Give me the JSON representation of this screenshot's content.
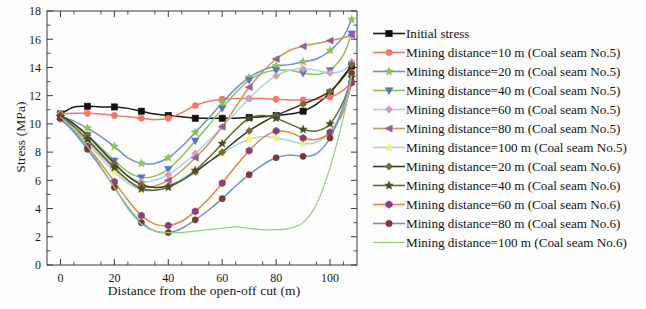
{
  "chart_data": {
    "type": "line",
    "title": "",
    "xlabel": "Distance from the open-off cut (m)",
    "ylabel": "Stress (MPa)",
    "xlim": [
      -5,
      110
    ],
    "ylim": [
      0,
      18
    ],
    "xticks": [
      0,
      20,
      40,
      60,
      80,
      100
    ],
    "yticks": [
      0,
      2,
      4,
      6,
      8,
      10,
      12,
      14,
      16,
      18
    ],
    "xtick_labels": [
      "0",
      "20",
      "40",
      "60",
      "80",
      "100"
    ],
    "ytick_labels": [
      "0",
      "2",
      "4",
      "6",
      "8",
      "10",
      "12",
      "14",
      "16",
      "18"
    ],
    "grid": false,
    "legend_position": "right",
    "series": [
      {
        "name": "Initial stress",
        "color": "#1a1a1a",
        "marker": "square",
        "marker_color": "#111111",
        "x": [
          0,
          5,
          10,
          15,
          20,
          25,
          30,
          35,
          40,
          45,
          50,
          55,
          60,
          65,
          70,
          75,
          80,
          85,
          90,
          95,
          100,
          105,
          108
        ],
        "y": [
          10.7,
          11.2,
          11.25,
          11.2,
          11.2,
          11.1,
          10.9,
          10.7,
          10.6,
          10.5,
          10.4,
          10.4,
          10.4,
          10.4,
          10.45,
          10.5,
          10.6,
          10.7,
          10.9,
          11.4,
          12.2,
          13.4,
          14.1
        ]
      },
      {
        "name": "Mining distance=10 m (Coal seam No.5)",
        "color": "#f4786a",
        "marker": "circle",
        "marker_color": "#f4786a",
        "x": [
          0,
          5,
          10,
          15,
          20,
          25,
          30,
          35,
          40,
          45,
          50,
          55,
          60,
          65,
          70,
          75,
          80,
          85,
          90,
          95,
          100,
          105,
          108
        ],
        "y": [
          10.7,
          10.75,
          10.75,
          10.7,
          10.6,
          10.5,
          10.4,
          10.3,
          10.4,
          10.8,
          11.3,
          11.6,
          11.75,
          11.8,
          11.8,
          11.8,
          11.75,
          11.7,
          11.7,
          11.75,
          11.9,
          12.4,
          13.0
        ]
      },
      {
        "name": "Mining distance=20 m (Coal seam No.5)",
        "color": "#6f8ed8",
        "marker": "star",
        "marker_color": "#8dc14f",
        "x": [
          0,
          5,
          10,
          15,
          20,
          25,
          30,
          35,
          40,
          45,
          50,
          55,
          60,
          65,
          70,
          75,
          80,
          85,
          90,
          95,
          100,
          105,
          108
        ],
        "y": [
          10.5,
          10.2,
          9.7,
          9.1,
          8.4,
          7.6,
          7.2,
          7.2,
          7.6,
          8.4,
          9.4,
          10.4,
          11.5,
          12.5,
          13.3,
          13.8,
          14.1,
          14.2,
          14.4,
          14.6,
          15.2,
          16.2,
          17.4
        ]
      },
      {
        "name": "Mining distance=40 m (Coal seam No.5)",
        "color": "#8dc14f",
        "marker": "triangle-down",
        "marker_color": "#5a73c4",
        "x": [
          0,
          5,
          10,
          15,
          20,
          25,
          30,
          35,
          40,
          45,
          50,
          55,
          60,
          65,
          70,
          75,
          80,
          85,
          90,
          95,
          100,
          105,
          108
        ],
        "y": [
          10.4,
          9.9,
          9.2,
          8.3,
          7.4,
          6.6,
          6.2,
          6.3,
          6.8,
          7.7,
          8.8,
          9.9,
          11.1,
          12.2,
          13.1,
          13.6,
          13.8,
          13.8,
          13.6,
          13.5,
          13.8,
          14.9,
          16.4
        ]
      },
      {
        "name": "Mining distance=60 m (Coal seam No.5)",
        "color": "#a8d4ea",
        "marker": "diamond",
        "marker_color": "#d99bbb",
        "x": [
          0,
          5,
          10,
          15,
          20,
          25,
          30,
          35,
          40,
          45,
          50,
          55,
          60,
          65,
          70,
          75,
          80,
          85,
          90,
          95,
          100,
          105,
          108
        ],
        "y": [
          10.4,
          9.8,
          9.0,
          8.1,
          7.1,
          6.3,
          5.9,
          6.0,
          6.4,
          7.1,
          7.9,
          8.8,
          9.8,
          10.8,
          11.8,
          12.7,
          13.4,
          13.8,
          13.9,
          13.8,
          13.6,
          13.8,
          14.4
        ]
      },
      {
        "name": "Mining distance=80 m (Coal seam No.5)",
        "color": "#c89a5f",
        "marker": "triangle-left",
        "marker_color": "#9a5b96",
        "x": [
          0,
          5,
          10,
          15,
          20,
          25,
          30,
          35,
          40,
          45,
          50,
          55,
          60,
          65,
          70,
          75,
          80,
          85,
          90,
          95,
          100,
          105,
          108
        ],
        "y": [
          10.3,
          9.6,
          8.8,
          7.8,
          6.8,
          6.0,
          5.5,
          5.6,
          6.0,
          6.7,
          7.6,
          8.6,
          9.8,
          11.2,
          12.6,
          13.7,
          14.6,
          15.2,
          15.5,
          15.7,
          15.9,
          16.1,
          16.3
        ]
      },
      {
        "name": "Mining distance=100 m (Coal seam No.5)",
        "color": "#a8d4ea",
        "marker": "star",
        "marker_color": "#f2ec7a",
        "x": [
          0,
          5,
          10,
          15,
          20,
          25,
          30,
          35,
          40,
          45,
          50,
          55,
          60,
          65,
          70,
          75,
          80,
          85,
          90,
          95,
          100,
          105,
          108
        ],
        "y": [
          10.3,
          9.5,
          8.6,
          7.6,
          6.6,
          5.8,
          5.3,
          5.3,
          5.6,
          6.1,
          6.7,
          7.3,
          7.9,
          8.5,
          8.9,
          9.1,
          9.0,
          8.8,
          8.6,
          8.7,
          9.4,
          11.2,
          13.2
        ]
      },
      {
        "name": "Mining distance=20 m (Coal seam No.6)",
        "color": "#3b3b1e",
        "marker": "diamond",
        "marker_color": "#7a6a3a",
        "x": [
          0,
          5,
          10,
          15,
          20,
          25,
          30,
          35,
          40,
          45,
          50,
          55,
          60,
          65,
          70,
          75,
          80,
          85,
          90,
          95,
          100,
          105,
          108
        ],
        "y": [
          10.6,
          10.0,
          9.2,
          8.2,
          7.2,
          6.3,
          5.7,
          5.5,
          5.6,
          6.0,
          6.6,
          7.3,
          8.0,
          8.8,
          9.5,
          10.1,
          10.6,
          11.0,
          11.4,
          11.8,
          12.3,
          13.3,
          14.2
        ]
      },
      {
        "name": "Mining distance=40 m (Coal seam No.6)",
        "color": "#5c6b2e",
        "marker": "star",
        "marker_color": "#4a4a28",
        "x": [
          0,
          5,
          10,
          15,
          20,
          25,
          30,
          35,
          40,
          45,
          50,
          55,
          60,
          65,
          70,
          75,
          80,
          85,
          90,
          95,
          100,
          105,
          108
        ],
        "y": [
          10.5,
          9.8,
          8.9,
          7.9,
          6.9,
          6.0,
          5.4,
          5.3,
          5.5,
          6.0,
          6.7,
          7.6,
          8.6,
          9.6,
          10.4,
          10.6,
          10.4,
          10.0,
          9.6,
          9.5,
          10.0,
          11.6,
          13.3
        ]
      },
      {
        "name": "Mining distance=60 m (Coal seam No.6)",
        "color": "#e8833f",
        "marker": "hexagon",
        "marker_color": "#8a3f7a",
        "x": [
          0,
          5,
          10,
          15,
          20,
          25,
          30,
          35,
          40,
          45,
          50,
          55,
          60,
          65,
          70,
          75,
          80,
          85,
          90,
          95,
          100,
          105,
          108
        ],
        "y": [
          10.4,
          9.5,
          8.4,
          7.2,
          5.9,
          4.6,
          3.5,
          2.9,
          2.8,
          3.1,
          3.8,
          4.7,
          5.8,
          7.0,
          8.1,
          9.0,
          9.5,
          9.4,
          9.0,
          8.9,
          9.4,
          10.9,
          12.9
        ]
      },
      {
        "name": "Mining distance=80 m (Coal seam No.6)",
        "color": "#6f8ed8",
        "marker": "circle",
        "marker_color": "#7a3a33",
        "x": [
          0,
          5,
          10,
          15,
          20,
          25,
          30,
          35,
          40,
          45,
          50,
          55,
          60,
          65,
          70,
          75,
          80,
          85,
          90,
          95,
          100,
          105,
          108
        ],
        "y": [
          10.4,
          9.4,
          8.2,
          6.9,
          5.5,
          4.1,
          3.0,
          2.4,
          2.3,
          2.6,
          3.2,
          3.9,
          4.7,
          5.6,
          6.4,
          7.1,
          7.6,
          7.8,
          7.7,
          7.9,
          9.0,
          11.3,
          13.6
        ]
      },
      {
        "name": "Mining distance=100 m (Coal seam No.6)",
        "color": "#8fcf7a",
        "marker": "none",
        "marker_color": "#8fcf7a",
        "x": [
          0,
          5,
          10,
          15,
          20,
          25,
          30,
          35,
          40,
          45,
          50,
          55,
          60,
          65,
          70,
          75,
          80,
          85,
          90,
          95,
          100,
          105,
          108
        ],
        "y": [
          10.5,
          9.6,
          8.4,
          7.0,
          5.5,
          4.0,
          2.9,
          2.4,
          2.3,
          2.3,
          2.4,
          2.5,
          2.6,
          2.7,
          2.6,
          2.5,
          2.5,
          2.6,
          3.0,
          4.3,
          6.9,
          10.5,
          13.4
        ]
      }
    ]
  },
  "legend": {
    "items": [
      {
        "label": "Initial stress"
      },
      {
        "label": "Mining distance=10 m (Coal seam No.5)"
      },
      {
        "label": "Mining distance=20 m (Coal seam No.5)"
      },
      {
        "label": "Mining distance=40 m (Coal seam No.5)"
      },
      {
        "label": "Mining distance=60 m (Coal seam No.5)"
      },
      {
        "label": "Mining distance=80 m (Coal seam No.5)"
      },
      {
        "label": "Mining distance=100 m (Coal seam No.5)"
      },
      {
        "label": "Mining distance=20 m (Coal seam No.6)"
      },
      {
        "label": "Mining distance=40 m (Coal seam No.6)"
      },
      {
        "label": "Mining distance=60 m (Coal seam No.6)"
      },
      {
        "label": "Mining distance=80 m (Coal seam No.6)"
      },
      {
        "label": "Mining distance=100 m (Coal seam No.6)"
      }
    ]
  },
  "axes": {
    "x_title": "Distance from the open-off cut (m)",
    "y_title": "Stress (MPa)"
  },
  "colors": {
    "axis": "#3a3a3a",
    "text": "#1a1a1a",
    "background": "#ffffff"
  }
}
